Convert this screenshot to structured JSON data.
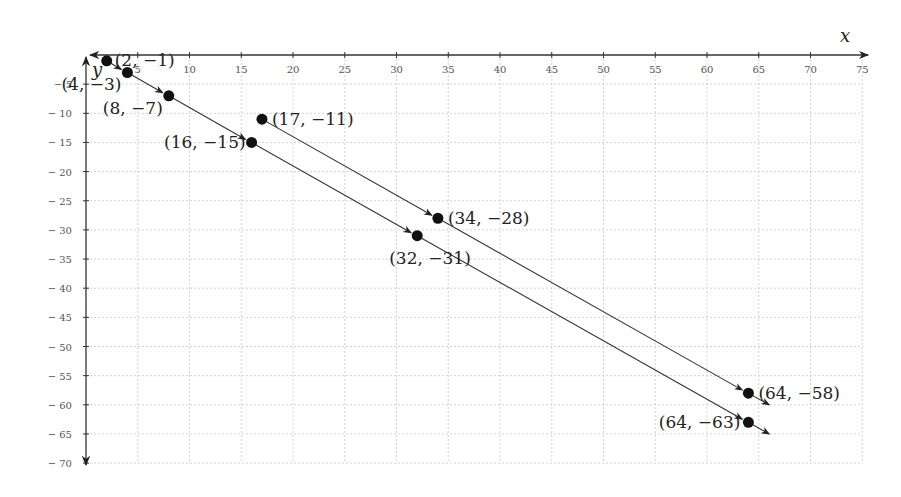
{
  "chart_data": {
    "type": "scatter",
    "title": "",
    "xlabel": "x",
    "ylabel": "y",
    "xlim": [
      0,
      75
    ],
    "ylim": [
      -70,
      0
    ],
    "grid": true,
    "x_ticks": [
      5,
      10,
      15,
      20,
      25,
      30,
      35,
      40,
      45,
      50,
      55,
      60,
      65,
      70,
      75
    ],
    "y_ticks": [
      -5,
      -10,
      -15,
      -20,
      -25,
      -30,
      -35,
      -40,
      -45,
      -50,
      -55,
      -60,
      -65,
      -70
    ],
    "series": [
      {
        "name": "path A",
        "points": [
          {
            "x": 2,
            "y": -1,
            "label": "(2, −1)"
          },
          {
            "x": 4,
            "y": -3,
            "label": "(4, −3)"
          },
          {
            "x": 8,
            "y": -7,
            "label": "(8, −7)"
          },
          {
            "x": 16,
            "y": -15,
            "label": "(16, −15)"
          },
          {
            "x": 32,
            "y": -31,
            "label": "(32, −31)"
          },
          {
            "x": 64,
            "y": -63,
            "label": "(64, −63)"
          }
        ]
      },
      {
        "name": "path B",
        "points": [
          {
            "x": 17,
            "y": -11,
            "label": "(17, −11)"
          },
          {
            "x": 34,
            "y": -28,
            "label": "(34, −28)"
          },
          {
            "x": 64,
            "y": -58,
            "label": "(64, −58)"
          }
        ]
      }
    ],
    "annotations": "Arrowed segments connect consecutive points; each series continues past its last point with an arrowhead."
  },
  "colors": {
    "axis": "#333333",
    "grid": "#c8c8c8",
    "point": "#111111",
    "text": "#222222"
  }
}
